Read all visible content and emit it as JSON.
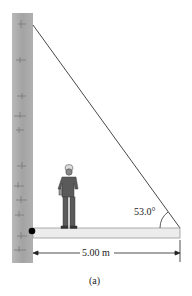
{
  "figure": {
    "caption": "(a)",
    "angle_label": "53.0°",
    "length_label": "5.00 m",
    "elements": [
      "wall",
      "cable",
      "beam",
      "pivot",
      "worker",
      "dimension-arrow"
    ],
    "colors": {
      "wall": "#a8a8a8",
      "wall_edge": "#8c8c8c",
      "beam_fill": "#ececec",
      "beam_edge": "#9a9a9a",
      "cable": "#333333",
      "pivot": "#000000",
      "worker": "#5a5a5a"
    }
  }
}
